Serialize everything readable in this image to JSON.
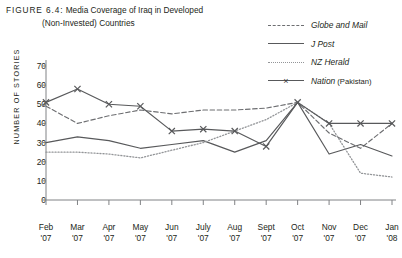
{
  "figure": {
    "label": "FIGURE 6.4:",
    "title_line1": "Media Coverage of Iraq in Developed",
    "title_line2": "(Non-Invested) Countries"
  },
  "axis": {
    "y_title": "NUMBER OF STORIES",
    "y_ticks": [
      70,
      60,
      50,
      40,
      30,
      20,
      10,
      0
    ]
  },
  "legend": {
    "items": [
      {
        "label": "Globe and Mail",
        "suffix": "",
        "style": "dashed",
        "marker": "none",
        "color": "#6d6e71"
      },
      {
        "label": "J Post",
        "suffix": "",
        "style": "solid",
        "marker": "none",
        "color": "#58595b"
      },
      {
        "label": "NZ Herald",
        "suffix": "",
        "style": "dotted",
        "marker": "none",
        "color": "#939598"
      },
      {
        "label": "Nation",
        "suffix": "(Pakistan)",
        "style": "solid",
        "marker": "x",
        "color": "#58595b"
      }
    ]
  },
  "chart_data": {
    "type": "line",
    "title": "Media Coverage of Iraq in Developed (Non-Invested) Countries",
    "xlabel": "",
    "ylabel": "NUMBER OF STORIES",
    "ylim": [
      0,
      70
    ],
    "ytick_step": 10,
    "grid": false,
    "legend_position": "top-right",
    "categories": [
      "Feb '07",
      "Mar '07",
      "Apr '07",
      "May '07",
      "Jun '07",
      "July '07",
      "Aug '07",
      "Sept '07",
      "Oct '07",
      "Nov '07",
      "Dec '07",
      "Jan '08"
    ],
    "series": [
      {
        "name": "Globe and Mail",
        "style": "dashed",
        "marker": "none",
        "color": "#6d6e71",
        "values": [
          49,
          40,
          44,
          47,
          45,
          47,
          47,
          48,
          51,
          35,
          27,
          40
        ]
      },
      {
        "name": "J Post",
        "style": "solid",
        "marker": "none",
        "color": "#58595b",
        "values": [
          30,
          33,
          31,
          27,
          29,
          31,
          25,
          31,
          51,
          24,
          29,
          23
        ]
      },
      {
        "name": "NZ Herald",
        "style": "dotted",
        "marker": "none",
        "color": "#939598",
        "values": [
          25,
          25,
          24,
          22,
          26,
          30,
          36,
          42,
          51,
          40,
          14,
          12
        ]
      },
      {
        "name": "Nation (Pakistan)",
        "style": "solid",
        "marker": "x",
        "color": "#58595b",
        "values": [
          51,
          58,
          50,
          49,
          36,
          37,
          36,
          28,
          51,
          40,
          40,
          40
        ]
      }
    ]
  }
}
